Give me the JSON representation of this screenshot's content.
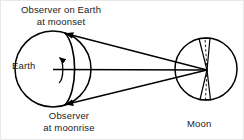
{
  "figure": {
    "background_color": "#ffffff",
    "stroke_color": "#000000"
  },
  "labels": {
    "observer_moonset": {
      "line1": "Observer on Earth",
      "line2": "at moonset"
    },
    "observer_moonrise": {
      "line1": "Observer",
      "line2": "at moonrise"
    },
    "earth": "Earth",
    "moon": "Moon"
  },
  "bodies": {
    "earth": {
      "name": "Earth",
      "center_x": 52,
      "center_y": 68,
      "radius": 38
    },
    "moon": {
      "name": "Moon",
      "center_x": 205,
      "center_y": 68,
      "radius": 31
    }
  },
  "sight_lines": {
    "count": 3,
    "converge_x": 206,
    "converge_y": 69,
    "from_moonset_observer": {
      "x": 63,
      "y": 32
    },
    "from_earth_center": {
      "x": 52,
      "y": 68
    },
    "from_moonrise_observer": {
      "x": 63,
      "y": 104
    }
  },
  "annotations": {
    "rotation_arrow": "earth-rotation-arrow",
    "terminator_arc": "earth-terminator-arc",
    "moon_cone": "moon-parallax-cone-dashed"
  }
}
